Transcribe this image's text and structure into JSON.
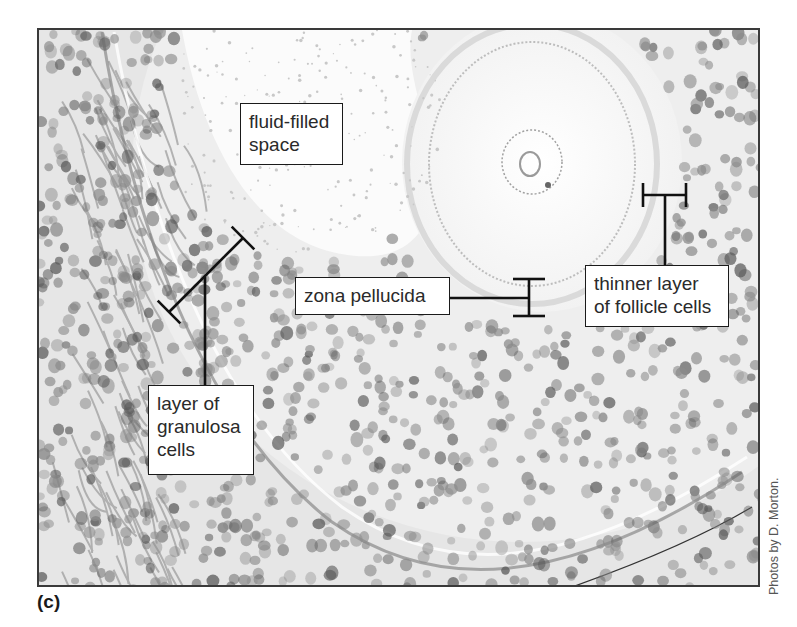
{
  "figure": {
    "panel_letter": "(c)",
    "credit": "Photos by D. Morton.",
    "colors": {
      "frame": "#3a3a3a",
      "background_tissue": "#f4f4f4",
      "nucleus": "#8a8a8a",
      "nucleus_dark": "#5a5a5a",
      "leader_line": "#111111",
      "label_text": "#2a2a2a"
    }
  },
  "labels": [
    {
      "id": "fluid-filled-space",
      "text": "fluid-filled\nspace",
      "box": {
        "x": 240,
        "y": 103,
        "w": 103,
        "h": 62
      }
    },
    {
      "id": "zona-pellucida",
      "text": "zona pellucida",
      "box": {
        "x": 295,
        "y": 277,
        "w": 155,
        "h": 38
      }
    },
    {
      "id": "thinner-follicle-layer",
      "text": "thinner layer\nof follicle cells",
      "box": {
        "x": 585,
        "y": 265,
        "w": 144,
        "h": 62
      }
    },
    {
      "id": "granulosa-layer",
      "text": "layer of\ngranulosa\ncells",
      "box": {
        "x": 148,
        "y": 385,
        "w": 106,
        "h": 90
      }
    }
  ],
  "leaders": {
    "granulosa": {
      "bar": [
        169,
        312,
        243,
        238
      ],
      "stem": [
        205,
        277,
        205,
        385
      ]
    },
    "zona": {
      "stem": [
        450,
        298,
        529,
        298
      ],
      "bar": [
        529,
        279,
        529,
        316
      ],
      "cap_half": 16
    },
    "follicle": {
      "stem": [
        665,
        265,
        665,
        195
      ],
      "bar": [
        643,
        195,
        686,
        195
      ],
      "cap_half": 12
    }
  }
}
